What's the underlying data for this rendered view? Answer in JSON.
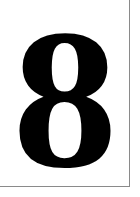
{
  "card": {
    "numeral": "8",
    "text_color": "#000000",
    "background_color": "#ffffff",
    "border_color": "#8a8a8a"
  }
}
